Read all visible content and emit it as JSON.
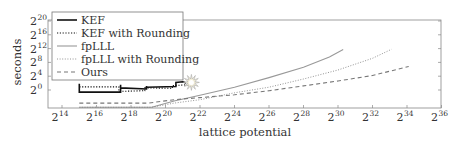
{
  "chart_data": {
    "type": "line",
    "title": "",
    "xlabel": "lattice potential",
    "ylabel": "seconds",
    "x_scale": "log2",
    "y_scale": "log2",
    "xlim_log2": [
      13.2,
      36
    ],
    "ylim_log2": [
      -5,
      21
    ],
    "x_ticks": [
      "2^14",
      "2^16",
      "2^18",
      "2^20",
      "2^22",
      "2^24",
      "2^26",
      "2^28",
      "2^30",
      "2^32",
      "2^34",
      "2^36"
    ],
    "x_tick_exps": [
      14,
      16,
      18,
      20,
      22,
      24,
      26,
      28,
      30,
      32,
      34,
      36
    ],
    "y_ticks": [
      "2^0",
      "2^4",
      "2^8",
      "2^12",
      "2^16",
      "2^20"
    ],
    "y_tick_exps": [
      0,
      4,
      8,
      12,
      16,
      20
    ],
    "grid": false,
    "legend_position": "upper left",
    "series": [
      {
        "name": "KEF",
        "style": "solid-thick",
        "color": "#111111",
        "points_log2": [
          [
            15,
            1.8
          ],
          [
            15,
            -0.6
          ],
          [
            17.4,
            -0.6
          ],
          [
            17.4,
            1.5
          ],
          [
            17.4,
            0.6
          ],
          [
            18.9,
            0.3
          ],
          [
            18.9,
            1.2
          ],
          [
            18.9,
            0.8
          ],
          [
            20.6,
            1.0
          ],
          [
            20.6,
            2.2
          ],
          [
            21,
            2.4
          ],
          [
            21.2,
            2.0
          ]
        ]
      },
      {
        "name": "KEF with Rounding",
        "style": "dotted",
        "color": "#111111",
        "points_log2": [
          [
            15,
            0.9
          ],
          [
            17.3,
            0.9
          ],
          [
            17.3,
            -0.4
          ],
          [
            18.8,
            -0.2
          ],
          [
            18.8,
            0.6
          ],
          [
            20.4,
            0.5
          ],
          [
            20.4,
            1.3
          ],
          [
            21.3,
            1.5
          ]
        ]
      },
      {
        "name": "fpLLL",
        "style": "solid",
        "color": "#999999",
        "points_log2": [
          [
            15,
            -5
          ],
          [
            19.2,
            -5
          ],
          [
            20.5,
            -3.2
          ],
          [
            22,
            -1.5
          ],
          [
            24,
            0.8
          ],
          [
            26,
            3.6
          ],
          [
            28,
            6.6
          ],
          [
            29.5,
            9.6
          ],
          [
            30.3,
            11.7
          ]
        ]
      },
      {
        "name": "fpLLL with Rounding",
        "style": "dotted-light",
        "color": "#888888",
        "points_log2": [
          [
            15,
            -5
          ],
          [
            19.2,
            -5
          ],
          [
            20.5,
            -3.8
          ],
          [
            22,
            -2.8
          ],
          [
            24,
            -0.8
          ],
          [
            26,
            0.8
          ],
          [
            28,
            3.2
          ],
          [
            30,
            5.8
          ],
          [
            32,
            9.2
          ],
          [
            33.1,
            11.8
          ]
        ]
      },
      {
        "name": "Ours",
        "style": "dashed",
        "color": "#777777",
        "points_log2": [
          [
            15,
            -3.8
          ],
          [
            19,
            -3.8
          ],
          [
            20.5,
            -2.8
          ],
          [
            22,
            -2.2
          ],
          [
            24,
            -1.4
          ],
          [
            26,
            -0.2
          ],
          [
            28,
            1.2
          ],
          [
            30,
            2.6
          ],
          [
            32,
            4.2
          ],
          [
            34.1,
            6.8
          ]
        ]
      }
    ],
    "annotations": [
      {
        "type": "starburst-marker",
        "x_log2": 21.5,
        "y_log2": 2.2
      }
    ]
  },
  "axes": {
    "xlabel": "lattice potential",
    "ylabel": "seconds",
    "x_tick_labels": [
      {
        "base": "2",
        "exp": "14"
      },
      {
        "base": "2",
        "exp": "16"
      },
      {
        "base": "2",
        "exp": "18"
      },
      {
        "base": "2",
        "exp": "20"
      },
      {
        "base": "2",
        "exp": "22"
      },
      {
        "base": "2",
        "exp": "24"
      },
      {
        "base": "2",
        "exp": "26"
      },
      {
        "base": "2",
        "exp": "28"
      },
      {
        "base": "2",
        "exp": "30"
      },
      {
        "base": "2",
        "exp": "32"
      },
      {
        "base": "2",
        "exp": "34"
      },
      {
        "base": "2",
        "exp": "36"
      }
    ],
    "y_tick_labels": [
      {
        "base": "2",
        "exp": "0"
      },
      {
        "base": "2",
        "exp": "4"
      },
      {
        "base": "2",
        "exp": "8"
      },
      {
        "base": "2",
        "exp": "12"
      },
      {
        "base": "2",
        "exp": "16"
      },
      {
        "base": "2",
        "exp": "20"
      }
    ]
  },
  "legend": {
    "entries": [
      "KEF",
      "KEF with Rounding",
      "fpLLL",
      "fpLLL with Rounding",
      "Ours"
    ]
  }
}
